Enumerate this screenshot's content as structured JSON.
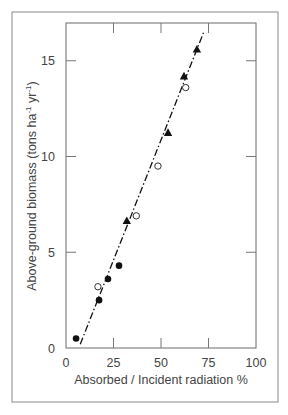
{
  "chart_data": {
    "type": "scatter",
    "title": "",
    "xlabel": "Absorbed / Incident radiation %",
    "ylabel": "Above-ground biomass (tons ha⁻¹ yr⁻¹)",
    "ylabel_parts": {
      "main": "Above-ground biomass (tons ha",
      "sup1": "-1",
      "mid": " yr",
      "sup2": "-1",
      "end": ")"
    },
    "xlim": [
      0,
      100
    ],
    "ylim": [
      0,
      17
    ],
    "xticks": [
      0,
      25,
      50,
      75,
      100
    ],
    "yticks": [
      0,
      5,
      10,
      15
    ],
    "xtick_labels": [
      "0",
      "25",
      "50",
      "75",
      "100"
    ],
    "ytick_labels": [
      "0",
      "5",
      "10",
      "15"
    ],
    "grid": false,
    "legend": null,
    "series": [
      {
        "name": "filled circles",
        "marker": "filled-circle",
        "points": [
          [
            5.3,
            0.5
          ],
          [
            17.4,
            2.5
          ],
          [
            22.1,
            3.6
          ],
          [
            27.9,
            4.3
          ]
        ]
      },
      {
        "name": "open circles",
        "marker": "open-circle",
        "points": [
          [
            16.8,
            3.2
          ],
          [
            37.0,
            6.9
          ],
          [
            48.4,
            9.5
          ],
          [
            63.0,
            13.6
          ]
        ]
      },
      {
        "name": "filled triangles",
        "marker": "filled-triangle",
        "points": [
          [
            32.0,
            6.65
          ],
          [
            53.7,
            11.25
          ],
          [
            62.1,
            14.2
          ],
          [
            68.9,
            15.6
          ]
        ]
      }
    ],
    "fit_line": {
      "style": "dash-dot",
      "from": [
        7.5,
        0.2
      ],
      "to": [
        72.5,
        16.5
      ]
    }
  }
}
